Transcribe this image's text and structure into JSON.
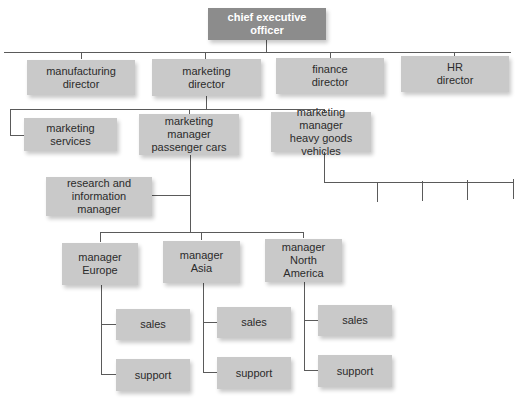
{
  "chart_title": "",
  "colors": {
    "ceo_box": "#8c8c8c",
    "box": "#c9c9c9",
    "line": "#5a5a5a",
    "ceo_text": "#ffffff",
    "text": "#2b2b2b"
  },
  "ceo": {
    "label": "chief executive officer"
  },
  "directors": [
    {
      "label": "manufacturing\ndirector"
    },
    {
      "label": "marketing\ndirector"
    },
    {
      "label": "finance\ndirector"
    },
    {
      "label": "HR\ndirector"
    }
  ],
  "marketing": {
    "services": {
      "label": "marketing services"
    },
    "passenger_cars": {
      "label": "marketing manager\npassenger cars"
    },
    "heavy_goods": {
      "label": "marketing manager\nheavy goods vehicles",
      "unlabeled_children": 4
    }
  },
  "research": {
    "label": "research and\ninformation manager"
  },
  "regional_managers": [
    {
      "label": "manager\nEurope",
      "children": [
        {
          "label": "sales"
        },
        {
          "label": "support"
        }
      ]
    },
    {
      "label": "manager\nAsia",
      "children": [
        {
          "label": "sales"
        },
        {
          "label": "support"
        }
      ]
    },
    {
      "label": "manager\nNorth America",
      "children": [
        {
          "label": "sales"
        },
        {
          "label": "support"
        }
      ]
    }
  ]
}
